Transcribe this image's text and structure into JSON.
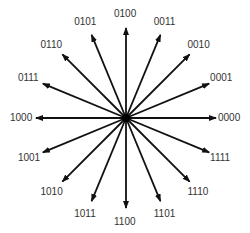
{
  "diagram": {
    "title": "",
    "type": "16-point constellation / phase diagram",
    "center": [
      126,
      118
    ],
    "radius": 90,
    "line_color": "#111111",
    "center_dot_color": "#000000",
    "points": [
      {
        "label": "0000",
        "angle_deg": 0
      },
      {
        "label": "0001",
        "angle_deg": 22.5
      },
      {
        "label": "0010",
        "angle_deg": 45
      },
      {
        "label": "0011",
        "angle_deg": 67.5
      },
      {
        "label": "0100",
        "angle_deg": 90
      },
      {
        "label": "0101",
        "angle_deg": 112.5
      },
      {
        "label": "0110",
        "angle_deg": 135
      },
      {
        "label": "0111",
        "angle_deg": 157.5
      },
      {
        "label": "1000",
        "angle_deg": 180
      },
      {
        "label": "1001",
        "angle_deg": 202.5
      },
      {
        "label": "1010",
        "angle_deg": 225
      },
      {
        "label": "1011",
        "angle_deg": 247.5
      },
      {
        "label": "1100",
        "angle_deg": 270
      },
      {
        "label": "1101",
        "angle_deg": 292.5
      },
      {
        "label": "1110",
        "angle_deg": 315
      },
      {
        "label": "1111",
        "angle_deg": 337.5
      }
    ]
  }
}
